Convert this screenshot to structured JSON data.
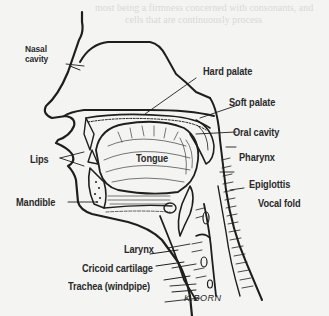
{
  "diagram": {
    "labels": {
      "nasal_cavity_line1": "Nasal",
      "nasal_cavity_line2": "cavity",
      "hard_palate": "Hard palate",
      "soft_palate": "Soft palate",
      "oral_cavity": "Oral cavity",
      "pharynx": "Pharynx",
      "lips": "Lips",
      "tongue": "Tongue",
      "epiglottis": "Epiglottis",
      "vocal_fold": "Vocal fold",
      "mandible": "Mandible",
      "larynx": "Larynx",
      "cricoid_cartilage": "Cricoid cartilage",
      "trachea": "Trachea (windpipe)"
    },
    "signature": "K.BORN"
  },
  "bleed_through_text": [
    "most being a firmness concerned with consonants, and",
    "cells that are continuously process"
  ],
  "colors": {
    "background": "#f4f4f2",
    "ink": "#1e1e1e",
    "bleed": "#d9d9d6"
  }
}
